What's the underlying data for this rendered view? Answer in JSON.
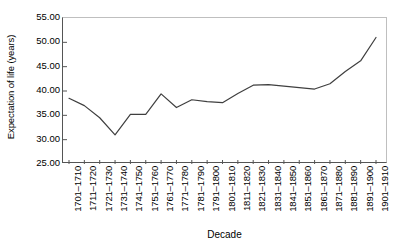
{
  "chart_data": {
    "type": "line",
    "title": "",
    "xlabel": "Decade",
    "ylabel": "Expectation of life (years)",
    "categories": [
      "1701–1710",
      "1711–1720",
      "1721–1730",
      "1731–1740",
      "1741–1750",
      "1751–1760",
      "1761–1770",
      "1771–1780",
      "1781–1790",
      "1791–1800",
      "1801–1810",
      "1811–1820",
      "1821–1830",
      "1831–1840",
      "1841–1850",
      "1851–1860",
      "1861–1870",
      "1871–1880",
      "1881–1890",
      "1891–1900",
      "1901–1910"
    ],
    "values": [
      38.5,
      37.0,
      34.5,
      31.0,
      35.2,
      35.2,
      39.4,
      36.6,
      38.2,
      37.8,
      37.6,
      39.5,
      41.2,
      41.3,
      41.0,
      40.7,
      40.4,
      41.5,
      44.0,
      46.2,
      51.0
    ],
    "ylim": [
      25.0,
      55.0
    ],
    "yticks": [
      25.0,
      30.0,
      35.0,
      40.0,
      45.0,
      50.0,
      55.0
    ],
    "ytick_labels": [
      "25.00",
      "30.00",
      "35.00",
      "40.00",
      "45.00",
      "50.00",
      "55.00"
    ],
    "grid": false,
    "legend": false,
    "series_color": "#3f3f3f",
    "axis_color": "#555555",
    "frame_color": "#bfbfbf"
  }
}
